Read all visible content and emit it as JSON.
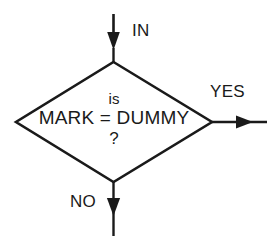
{
  "diagram": {
    "type": "flowchart-decision",
    "background_color": "#ffffff",
    "stroke_color": "#1a1a1a",
    "decision": {
      "shape": "diamond",
      "text_lines": [
        "is",
        "MARK = DUMMY",
        "?"
      ],
      "line_1": "is",
      "line_2": "MARK = DUMMY",
      "line_3": "?"
    },
    "connectors": {
      "input": {
        "label": "IN",
        "direction": "down",
        "arrow": "solid-triangle"
      },
      "branch_true": {
        "label": "YES",
        "direction": "right",
        "arrow": "solid-triangle"
      },
      "branch_false": {
        "label": "NO",
        "direction": "down",
        "arrow": "solid-triangle"
      }
    }
  }
}
